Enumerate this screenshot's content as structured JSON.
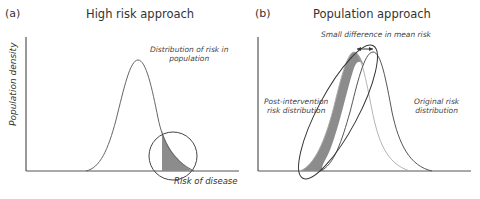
{
  "panel_a": {
    "label": "(a)",
    "title": "High risk approach",
    "y_axis_label": "Population density",
    "x_axis_label": "Risk of disease",
    "annotation": [
      "Distribution of risk in",
      "population"
    ]
  },
  "panel_b": {
    "label": "(b)",
    "title": "Population approach",
    "annotation_top": "Small difference in mean risk",
    "annotation_left": [
      "Post-intervention",
      "risk distribution"
    ],
    "annotation_right": [
      "Original risk",
      "distribution"
    ]
  },
  "colors": {
    "line": "#555555",
    "thin_line": "#9a9a9a",
    "shade": "#8c8c8c",
    "axis": "#555555"
  }
}
